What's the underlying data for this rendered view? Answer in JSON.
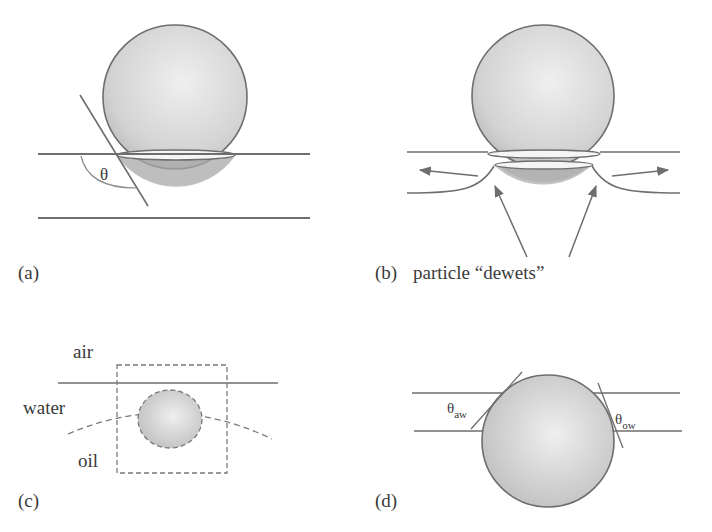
{
  "figure": {
    "panels": [
      {
        "id": "a",
        "label": "(a)",
        "angle_symbol": "θ"
      },
      {
        "id": "b",
        "label": "(b)",
        "annotation": "particle “dewets”"
      },
      {
        "id": "c",
        "label": "(c)",
        "phases": {
          "air": "air",
          "water": "water",
          "oil": "oil"
        }
      },
      {
        "id": "d",
        "label": "(d)",
        "angle_aw": {
          "symbol": "θ",
          "subscript": "aw"
        },
        "angle_ow": {
          "symbol": "θ",
          "subscript": "ow"
        }
      }
    ],
    "colors": {
      "line": "#6e6e6e",
      "sphere_light": "#ececec",
      "sphere_dark": "#b8b8b8",
      "immersed_cap": "#a9a9a9",
      "text": "#3a3a3a"
    }
  }
}
